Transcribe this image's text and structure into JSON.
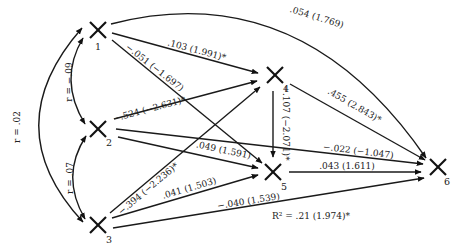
{
  "diagram": {
    "type": "path-diagram",
    "nodes": [
      {
        "id": "1",
        "label": "1",
        "x": 98,
        "y": 30
      },
      {
        "id": "2",
        "label": "2",
        "x": 98,
        "y": 129
      },
      {
        "id": "3",
        "label": "3",
        "x": 98,
        "y": 225
      },
      {
        "id": "4",
        "label": "4",
        "x": 275,
        "y": 75
      },
      {
        "id": "5",
        "label": "5",
        "x": 273,
        "y": 172
      },
      {
        "id": "6",
        "label": "6",
        "x": 438,
        "y": 167
      }
    ],
    "correlations": [
      {
        "from": "1",
        "to": "2",
        "label": "r = −.09"
      },
      {
        "from": "2",
        "to": "3",
        "label": "r = .07"
      },
      {
        "from": "1",
        "to": "3",
        "label": "r = .02"
      }
    ],
    "paths": [
      {
        "from": "1",
        "to": "6",
        "label": ".054 (1.769)"
      },
      {
        "from": "1",
        "to": "4",
        "label": ".103 (1.991)*"
      },
      {
        "from": "1",
        "to": "5",
        "label": "−.051 (−1.697)"
      },
      {
        "from": "2",
        "to": "4",
        "label": "−.524 (−2.631)*"
      },
      {
        "from": "2",
        "to": "5",
        "label": ".049 (1.591)"
      },
      {
        "from": "2",
        "to": "6",
        "label": "−.022 (−1.047)"
      },
      {
        "from": "3",
        "to": "4",
        "label": "−.394 (−2.236)*"
      },
      {
        "from": "3",
        "to": "5",
        "label": ".041 (1.503)"
      },
      {
        "from": "3",
        "to": "6",
        "label": "−.040 (1.539)"
      },
      {
        "from": "4",
        "to": "5",
        "label": "−.107 (−2.071)*"
      },
      {
        "from": "4",
        "to": "6",
        "label": ".455 (2.843)*"
      },
      {
        "from": "5",
        "to": "6",
        "label": ".043 (1.611)"
      }
    ],
    "r_squared": "R² = .21 (1.974)*"
  }
}
